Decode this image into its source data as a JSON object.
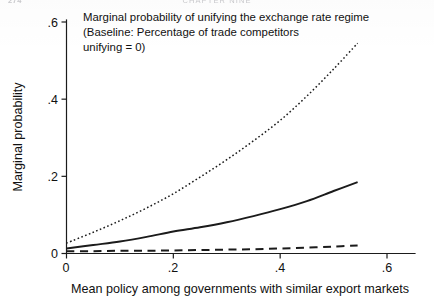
{
  "page": {
    "folio": "274",
    "running_head": "CHAPTER NINE"
  },
  "annotation": {
    "line1": "Marginal probability of unifying the exchange rate regime",
    "line2": "(Baseline: Percentage of trade competitors",
    "line3": "unifying = 0)"
  },
  "axes": {
    "y_title": "Marginal probability",
    "x_title": "Mean policy among governments with similar export markets",
    "y_ticks": [
      "0",
      ".2",
      ".4",
      ".6"
    ],
    "x_ticks": [
      "0",
      ".2",
      ".4",
      ".6"
    ]
  },
  "chart_data": {
    "type": "line",
    "title": "Marginal probability of unifying the exchange rate regime",
    "subtitle": "(Baseline: Percentage of trade competitors unifying = 0)",
    "xlabel": "Mean policy among governments with similar export markets",
    "ylabel": "Marginal probability",
    "xlim": [
      0,
      0.6
    ],
    "ylim": [
      0,
      0.6
    ],
    "xticks": [
      0,
      0.2,
      0.4,
      0.6
    ],
    "yticks": [
      0,
      0.2,
      0.4,
      0.6
    ],
    "grid": false,
    "legend": "none",
    "x": [
      0,
      0.05,
      0.1,
      0.15,
      0.2,
      0.25,
      0.3,
      0.35,
      0.4,
      0.45,
      0.5,
      0.545
    ],
    "series": [
      {
        "name": "upper",
        "style": "dotted",
        "values": [
          0.027,
          0.055,
          0.085,
          0.118,
          0.155,
          0.198,
          0.243,
          0.292,
          0.345,
          0.408,
          0.478,
          0.545
        ]
      },
      {
        "name": "point-estimate",
        "style": "solid",
        "values": [
          0.013,
          0.022,
          0.031,
          0.043,
          0.057,
          0.068,
          0.081,
          0.097,
          0.115,
          0.136,
          0.162,
          0.185
        ]
      },
      {
        "name": "lower",
        "style": "dashed",
        "values": [
          0.006,
          0.006,
          0.007,
          0.007,
          0.008,
          0.009,
          0.01,
          0.011,
          0.013,
          0.015,
          0.018,
          0.021
        ]
      }
    ]
  }
}
